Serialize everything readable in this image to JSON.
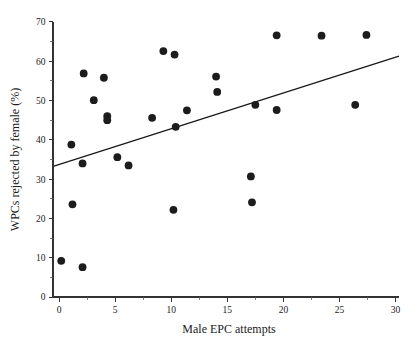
{
  "chart_data": {
    "type": "scatter",
    "title": "",
    "xlabel": "Male EPC attempts",
    "ylabel": "WPCs rejected by female (%)",
    "xlim": [
      -1.5,
      30.5
    ],
    "ylim": [
      0,
      70
    ],
    "xticks": [
      0,
      5,
      10,
      15,
      20,
      25,
      30
    ],
    "xtick_labels": [
      "0",
      "5",
      "10",
      "15",
      "20",
      "25",
      "30"
    ],
    "yticks": [
      0,
      10,
      20,
      30,
      40,
      50,
      60,
      70
    ],
    "ytick_labels": [
      "0",
      "10",
      "20",
      "30",
      "40",
      "50",
      "60",
      "70"
    ],
    "x_minor_ticks": [
      2.5,
      7.5,
      12.5,
      17.5,
      22.5,
      27.5
    ],
    "grid": false,
    "legend": false,
    "marker": "filled-circle",
    "marker_color": "#1c1c1c",
    "marker_size": 6,
    "points": [
      {
        "x": 0.2,
        "y": 9.2
      },
      {
        "x": 1.1,
        "y": 38.8
      },
      {
        "x": 1.2,
        "y": 23.6
      },
      {
        "x": 2.1,
        "y": 7.6
      },
      {
        "x": 2.1,
        "y": 34.0
      },
      {
        "x": 2.2,
        "y": 56.9
      },
      {
        "x": 3.1,
        "y": 50.1
      },
      {
        "x": 4.0,
        "y": 55.8
      },
      {
        "x": 4.3,
        "y": 46.0
      },
      {
        "x": 4.3,
        "y": 45.0
      },
      {
        "x": 5.2,
        "y": 35.6
      },
      {
        "x": 6.2,
        "y": 33.5
      },
      {
        "x": 8.3,
        "y": 45.6
      },
      {
        "x": 9.3,
        "y": 62.6
      },
      {
        "x": 10.2,
        "y": 22.2
      },
      {
        "x": 10.3,
        "y": 61.7
      },
      {
        "x": 10.4,
        "y": 43.3
      },
      {
        "x": 11.4,
        "y": 47.5
      },
      {
        "x": 14.0,
        "y": 56.1
      },
      {
        "x": 14.1,
        "y": 52.2
      },
      {
        "x": 17.1,
        "y": 30.7
      },
      {
        "x": 17.2,
        "y": 24.1
      },
      {
        "x": 17.5,
        "y": 48.9
      },
      {
        "x": 19.4,
        "y": 47.6
      },
      {
        "x": 19.4,
        "y": 66.6
      },
      {
        "x": 23.4,
        "y": 66.5
      },
      {
        "x": 26.4,
        "y": 48.9
      },
      {
        "x": 27.4,
        "y": 66.7
      }
    ],
    "fit_line": {
      "type": "linear-regression",
      "color": "#171717",
      "x_start": -0.45,
      "y_start": 33.3,
      "x_end": 30.3,
      "y_end": 61.3,
      "slope": 0.91,
      "intercept": 33.71
    }
  }
}
